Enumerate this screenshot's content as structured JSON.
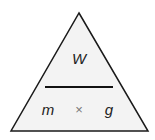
{
  "diagram": {
    "type": "formula-triangle",
    "top": "W",
    "bottom_left": "m",
    "operator": "×",
    "bottom_right": "g",
    "colors": {
      "background": "#ffffff",
      "fill": "#f3f3f3",
      "stroke": "#1a1a1a",
      "text": "#222222",
      "operator": "#777777"
    }
  }
}
